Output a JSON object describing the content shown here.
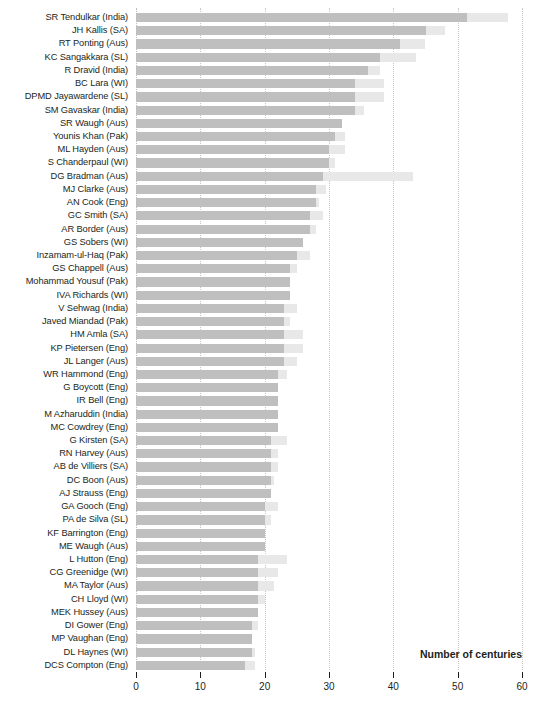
{
  "chart_data": {
    "type": "bar",
    "orientation": "horizontal",
    "stacked": true,
    "title": "",
    "subtitle": "",
    "xlabel": "Number of centuries",
    "ylabel": "",
    "xlim": [
      0,
      60
    ],
    "xticks": [
      0,
      10,
      20,
      30,
      40,
      50,
      60
    ],
    "xtick_labels": [
      "0",
      "10",
      "20",
      "30",
      "40",
      "50",
      "60"
    ],
    "grid": true,
    "grid_axis": "x",
    "legend": false,
    "legend_position": "none",
    "colors": {
      "segment_a": "#bfbfbf",
      "segment_b": "#e8e8e8",
      "text": "#231f20",
      "gridline": "#c9c6c4",
      "background": "#ffffff"
    },
    "series": [
      {
        "name": "Segment A",
        "color": "#bfbfbf"
      },
      {
        "name": "Segment B",
        "color": "#e8e8e8"
      }
    ],
    "categories": [
      "SR Tendulkar (India)",
      "JH Kallis (SA)",
      "RT Ponting (Aus)",
      "KC Sangakkara (SL)",
      "R Dravid (India)",
      "BC Lara (WI)",
      "DPMD Jayawardene (SL)",
      "SM Gavaskar (India)",
      "SR Waugh (Aus)",
      "Younis Khan (Pak)",
      "ML Hayden (Aus)",
      "S Chanderpaul (WI)",
      "DG Bradman (Aus)",
      "MJ Clarke (Aus)",
      "AN Cook (Eng)",
      "GC Smith (SA)",
      "AR Border (Aus)",
      "GS Sobers (WI)",
      "Inzamam-ul-Haq (Pak)",
      "GS Chappell (Aus)",
      "Mohammad Yousuf (Pak)",
      "IVA Richards (WI)",
      "V Sehwag (India)",
      "Javed Miandad (Pak)",
      "HM Amla (SA)",
      "KP Pietersen (Eng)",
      "JL Langer (Aus)",
      "WR Hammond (Eng)",
      "G Boycott (Eng)",
      "IR Bell (Eng)",
      "M Azharuddin (India)",
      "MC Cowdrey (Eng)",
      "G Kirsten (SA)",
      "RN Harvey (Aus)",
      "AB de Villiers (SA)",
      "DC Boon (Aus)",
      "AJ Strauss (Eng)",
      "GA Gooch (Eng)",
      "PA de Silva (SL)",
      "KF Barrington (Eng)",
      "ME Waugh (Aus)",
      "L Hutton (Eng)",
      "CG Greenidge (WI)",
      "MA Taylor (Aus)",
      "CH Lloyd (WI)",
      "MEK Hussey (Aus)",
      "DI Gower (Eng)",
      "MP Vaughan (Eng)",
      "DL Haynes (WI)",
      "DCS Compton (Eng)"
    ],
    "values_a": [
      51.5,
      45.0,
      41.0,
      38.0,
      36.0,
      34.0,
      34.0,
      34.0,
      32.0,
      31.0,
      30.0,
      30.0,
      29.0,
      28.0,
      28.0,
      27.0,
      27.0,
      26.0,
      25.0,
      24.0,
      24.0,
      24.0,
      23.0,
      23.0,
      23.0,
      23.0,
      23.0,
      22.0,
      22.0,
      22.0,
      22.0,
      22.0,
      21.0,
      21.0,
      21.0,
      21.0,
      21.0,
      20.0,
      20.0,
      20.0,
      20.0,
      19.0,
      19.0,
      19.0,
      19.0,
      19.0,
      18.0,
      18.0,
      18.0,
      17.0
    ],
    "values_b": [
      6.3,
      3.0,
      4.0,
      5.5,
      2.0,
      4.5,
      4.5,
      1.5,
      0.0,
      1.5,
      2.5,
      1.0,
      14.0,
      1.5,
      0.5,
      2.0,
      1.0,
      0.0,
      2.0,
      1.0,
      0.0,
      0.0,
      2.0,
      1.0,
      3.0,
      3.0,
      2.0,
      1.5,
      0.0,
      0.0,
      0.0,
      0.0,
      2.5,
      1.0,
      1.0,
      0.5,
      0.0,
      2.0,
      1.0,
      0.0,
      0.0,
      4.5,
      3.0,
      2.5,
      1.0,
      0.0,
      1.0,
      0.0,
      0.5,
      1.5
    ],
    "totals": [
      57.8,
      48.0,
      45.0,
      43.5,
      38.0,
      38.5,
      38.5,
      35.5,
      32.0,
      32.5,
      32.5,
      31.0,
      43.0,
      29.5,
      28.5,
      29.0,
      28.0,
      26.0,
      27.0,
      25.0,
      24.0,
      24.0,
      25.0,
      24.0,
      26.0,
      26.0,
      25.0,
      23.5,
      22.0,
      22.0,
      22.0,
      22.0,
      23.5,
      22.0,
      22.0,
      21.5,
      21.0,
      22.0,
      21.0,
      20.0,
      20.0,
      23.5,
      22.0,
      21.5,
      20.0,
      19.0,
      19.0,
      18.0,
      18.5,
      18.5
    ]
  }
}
